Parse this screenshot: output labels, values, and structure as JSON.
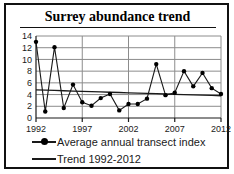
{
  "figure": {
    "title": "Surrey abundance trend",
    "frame_color": "#111111",
    "background": "#ffffff"
  },
  "legend": {
    "position": "bottom-left",
    "items": [
      {
        "label": "Average annual transect index",
        "marker": "line-with-dot",
        "color": "#1a1a1a"
      },
      {
        "label": "Trend 1992-2012",
        "marker": "line",
        "color": "#1a1a1a"
      }
    ]
  },
  "chart_data": {
    "type": "line",
    "title": "Surrey abundance trend",
    "xlabel": "",
    "ylabel": "",
    "grid": true,
    "xlim": [
      1992,
      2012
    ],
    "ylim": [
      0,
      14
    ],
    "yticks": [
      0,
      2,
      4,
      6,
      8,
      10,
      12,
      14
    ],
    "ytick_labels": [
      "0",
      "2",
      "4",
      "6",
      "8",
      "10",
      "12",
      "14"
    ],
    "xticks": [
      1992,
      1997,
      2002,
      2007,
      2012
    ],
    "xtick_labels": [
      "1992",
      "1997",
      "2002",
      "2007",
      "2012"
    ],
    "x": [
      1992,
      1993,
      1994,
      1995,
      1996,
      1997,
      1998,
      1999,
      2000,
      2001,
      2002,
      2003,
      2004,
      2005,
      2006,
      2007,
      2008,
      2009,
      2010,
      2011,
      2012
    ],
    "series": [
      {
        "name": "Average annual transect index",
        "marker": "circle",
        "color": "#1a1a1a",
        "values": [
          13.0,
          1.1,
          12.1,
          1.7,
          5.7,
          2.7,
          2.1,
          3.4,
          4.1,
          1.3,
          2.4,
          2.4,
          3.3,
          9.2,
          3.9,
          4.3,
          8.0,
          5.4,
          7.7,
          5.1,
          4.1
        ]
      },
      {
        "name": "Trend 1992-2012",
        "marker": "none",
        "color": "#1a1a1a",
        "values": [
          4.8,
          4.75,
          4.7,
          4.65,
          4.6,
          4.55,
          4.5,
          4.45,
          4.4,
          4.35,
          4.3,
          4.25,
          4.2,
          4.15,
          4.1,
          4.05,
          4.0,
          3.95,
          3.9,
          3.85,
          3.8
        ]
      }
    ]
  }
}
